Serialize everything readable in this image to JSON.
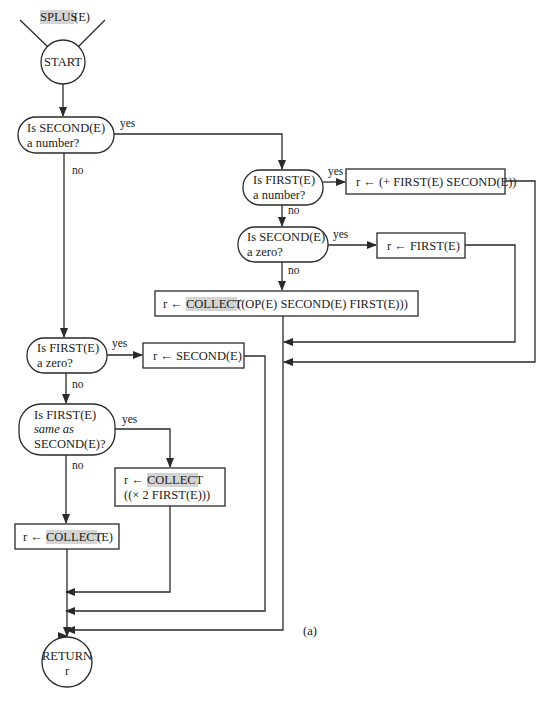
{
  "figure": {
    "entry_label": "SPLUS(E)",
    "entry_label_highlight": "SPLUS",
    "entry_label_rest": "(E)",
    "caption": "(a)",
    "highlight_color": "#d4d4d4",
    "line_color": "#2a2a2a"
  },
  "nodes": {
    "start": {
      "type": "terminal",
      "text": "START"
    },
    "d_second_number": {
      "type": "decision",
      "line1": "Is SECOND(E)",
      "line2": "a number?"
    },
    "d_first_number": {
      "type": "decision",
      "line1": "Is FIRST(E)",
      "line2": "a number?"
    },
    "p_plus": {
      "type": "process",
      "text": "r ← (+  FIRST(E) SECOND(E))"
    },
    "d_second_zero": {
      "type": "decision",
      "line1": "Is SECOND(E)",
      "line2": "a zero?"
    },
    "p_first": {
      "type": "process",
      "text": "r ← FIRST(E)"
    },
    "p_collect_op": {
      "type": "process",
      "prefix": "r ← ",
      "highlight": "COLLECT",
      "suffix": "((OP(E)  SECOND(E)  FIRST(E)))"
    },
    "d_first_zero": {
      "type": "decision",
      "line1": "Is FIRST(E)",
      "line2": "a zero?"
    },
    "p_second": {
      "type": "process",
      "text": "r ← SECOND(E)"
    },
    "d_same": {
      "type": "decision",
      "line1": "Is FIRST(E)",
      "line2": "same as",
      "line3": "SECOND(E)?"
    },
    "p_collect_times": {
      "type": "process",
      "prefix": "r ← ",
      "highlight": "COLLECT",
      "line2": "((×  2  FIRST(E)))"
    },
    "p_collect_e": {
      "type": "process",
      "prefix": "r ← ",
      "highlight": "COLLECT",
      "suffix": "(E)"
    },
    "return": {
      "type": "terminal",
      "line1": "RETURN",
      "line2": "r"
    }
  },
  "edge_labels": {
    "yes": "yes",
    "no": "no"
  }
}
